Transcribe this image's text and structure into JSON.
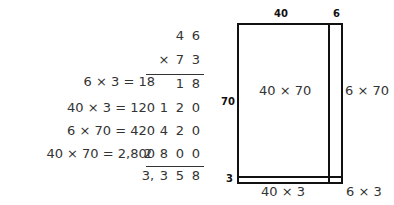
{
  "equations": [
    "6 × 3 = 18",
    "40 × 3 = 120",
    "6 × 70 = 420",
    "40 × 70 = 2,800"
  ],
  "vertical_multiplication": {
    "multiplicand": [
      "4",
      "6"
    ],
    "multiplier": [
      "×",
      "7",
      "3"
    ],
    "partials": [
      [
        "",
        "",
        "1",
        "8"
      ],
      [
        "",
        "1",
        "2",
        "0"
      ],
      [
        "",
        "4",
        "2",
        "0"
      ],
      [
        "2",
        "8",
        "0",
        "0"
      ]
    ],
    "result": [
      "3,",
      "3",
      "5",
      "8"
    ]
  },
  "area_model": {
    "top_labels": [
      "40",
      "6"
    ],
    "side_labels": [
      "70",
      "3"
    ],
    "cells": {
      "big": "40 × 70",
      "right": "6 × 70",
      "bottom": "40 × 3",
      "corner": "6 × 3"
    }
  }
}
